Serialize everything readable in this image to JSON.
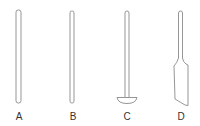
{
  "figure": {
    "stroke_color": "#8a8a8a",
    "fill_color": "#ffffff",
    "label_color": "#333333",
    "tools": [
      {
        "id": "A",
        "label": "A",
        "shape": "plain-rod-wide"
      },
      {
        "id": "B",
        "label": "B",
        "shape": "plain-rod-narrow"
      },
      {
        "id": "C",
        "label": "C",
        "shape": "rod-with-half-disc-foot"
      },
      {
        "id": "D",
        "label": "D",
        "shape": "rod-with-flat-angled-blade"
      }
    ]
  }
}
